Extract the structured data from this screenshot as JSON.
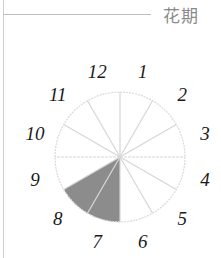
{
  "title": "花期",
  "chart_data": {
    "type": "pie",
    "title": "花期",
    "categories": [
      "1",
      "2",
      "3",
      "4",
      "5",
      "6",
      "7",
      "8",
      "9",
      "10",
      "11",
      "12"
    ],
    "values": [
      0,
      0,
      0,
      0,
      0,
      0,
      1,
      1,
      0,
      0,
      0,
      0
    ],
    "highlighted_months": [
      7,
      8
    ],
    "colors": {
      "highlight": "#8c8c8c",
      "empty": "#ffffff",
      "divider": "#d6d6d6"
    }
  },
  "labels": [
    "1",
    "2",
    "3",
    "4",
    "5",
    "6",
    "7",
    "8",
    "9",
    "10",
    "11",
    "12"
  ]
}
